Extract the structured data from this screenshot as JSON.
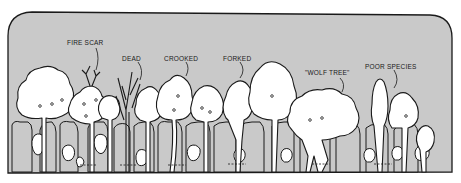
{
  "figure": {
    "colors": {
      "panel_fill": "#c9c9c9",
      "panel_stroke": "#1a1a1a",
      "tree_fill": "#ffffff",
      "page_background": "#ffffff"
    },
    "labels": [
      {
        "id": "fire-scar",
        "text": "FIRE SCAR",
        "x": 67,
        "y": 40
      },
      {
        "id": "dead",
        "text": "DEAD",
        "x": 122,
        "y": 56
      },
      {
        "id": "crooked",
        "text": "CROOKED",
        "x": 164,
        "y": 56
      },
      {
        "id": "forked",
        "text": "FORKED",
        "x": 223,
        "y": 56
      },
      {
        "id": "wolf-tree",
        "text": "\"WOLF TREE\"",
        "x": 305,
        "y": 70
      },
      {
        "id": "poor-species",
        "text": "POOR SPECIES",
        "x": 365,
        "y": 64
      }
    ]
  }
}
